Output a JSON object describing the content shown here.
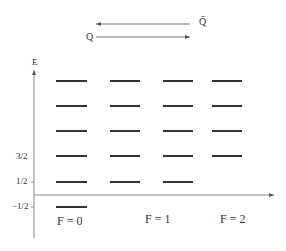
{
  "diagram": {
    "arrows": {
      "qbar_label": "Q̄",
      "q_label": "Q"
    },
    "axis": {
      "y_label": "E",
      "ticks": [
        "3/2",
        "1/2",
        "−1/2"
      ]
    },
    "columns": [
      {
        "label": "F = 0",
        "levels": 6
      },
      {
        "label": "F = 1",
        "levels": 5
      },
      {
        "label": "F = 2",
        "levels": 4
      },
      {
        "label": "",
        "levels": 4
      }
    ],
    "colors": {
      "line": "#333333",
      "axis": "#888888"
    }
  }
}
